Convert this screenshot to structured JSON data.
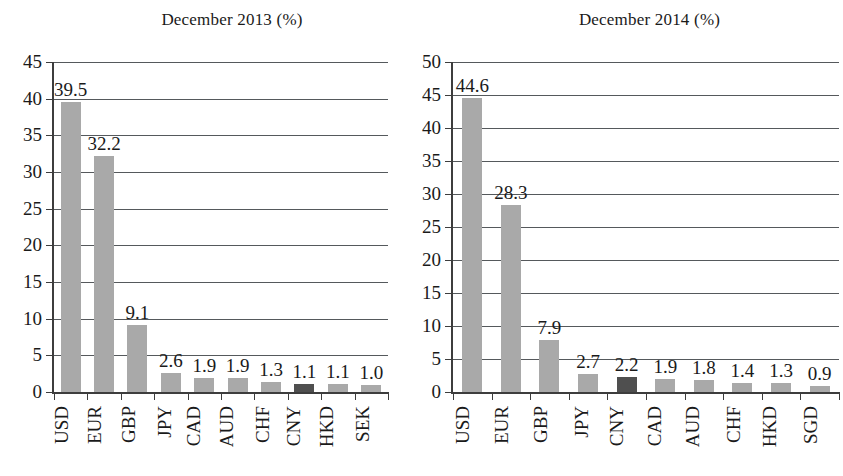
{
  "chart_data": [
    {
      "type": "bar",
      "id": "december-2013",
      "title": "December 2013 (%)",
      "xlabel": "",
      "ylabel": "",
      "ylim": [
        0,
        45
      ],
      "ystep": 5,
      "yticks": [
        0,
        5,
        10,
        15,
        20,
        25,
        30,
        35,
        40,
        45
      ],
      "grid": true,
      "legend": "none",
      "categories": [
        "USD",
        "EUR",
        "GBP",
        "JPY",
        "CAD",
        "AUD",
        "CHF",
        "CNY",
        "HKD",
        "SEK"
      ],
      "values": [
        39.5,
        32.2,
        9.1,
        2.6,
        1.9,
        1.9,
        1.3,
        1.1,
        1.1,
        1.0
      ],
      "labels": [
        "39.5",
        "32.2",
        "9.1",
        "2.6",
        "1.9",
        "1.9",
        "1.3",
        "1.1",
        "1.1",
        "1.0"
      ],
      "highlighted": [
        "CNY"
      ],
      "bar_color": "#a9a9a9",
      "highlight_color": "#4f4f4f"
    },
    {
      "type": "bar",
      "id": "december-2014",
      "title": "December 2014 (%)",
      "xlabel": "",
      "ylabel": "",
      "ylim": [
        0,
        50
      ],
      "ystep": 5,
      "yticks": [
        0,
        5,
        10,
        15,
        20,
        25,
        30,
        35,
        40,
        45,
        50
      ],
      "grid": true,
      "legend": "none",
      "categories": [
        "USD",
        "EUR",
        "GBP",
        "JPY",
        "CNY",
        "CAD",
        "AUD",
        "CHF",
        "HKD",
        "SGD"
      ],
      "values": [
        44.6,
        28.3,
        7.9,
        2.7,
        2.2,
        1.9,
        1.8,
        1.4,
        1.3,
        0.9
      ],
      "labels": [
        "44.6",
        "28.3",
        "7.9",
        "2.7",
        "2.2",
        "1.9",
        "1.8",
        "1.4",
        "1.3",
        "0.9"
      ],
      "highlighted": [
        "CNY"
      ],
      "bar_color": "#a9a9a9",
      "highlight_color": "#4f4f4f"
    }
  ]
}
